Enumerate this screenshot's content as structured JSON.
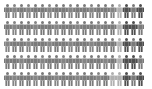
{
  "chart_data": {
    "type": "pictogram",
    "title": "",
    "rows": 5,
    "columns": 20,
    "total_icons": 100,
    "icon": "person-icon",
    "palette": {
      "medium": "#7a7a7a",
      "medium_alt": "#858585",
      "light": "#b0b0b0",
      "dark": "#4f4f4f"
    },
    "grid": [
      [
        "medium",
        "medium_alt",
        "medium",
        "medium_alt",
        "medium",
        "medium",
        "medium_alt",
        "medium",
        "medium",
        "medium_alt",
        "medium",
        "medium",
        "medium_alt",
        "medium",
        "medium",
        "medium_alt",
        "light",
        "dark",
        "medium",
        "dark"
      ],
      [
        "medium",
        "medium_alt",
        "medium",
        "medium",
        "medium_alt",
        "medium",
        "medium",
        "medium_alt",
        "medium",
        "medium",
        "medium_alt",
        "medium",
        "medium",
        "medium_alt",
        "medium",
        "medium",
        "light",
        "dark",
        "dark",
        "medium"
      ],
      [
        "medium_alt",
        "medium",
        "medium",
        "medium_alt",
        "medium",
        "medium",
        "medium_alt",
        "medium",
        "medium",
        "medium_alt",
        "medium",
        "medium",
        "medium_alt",
        "medium",
        "medium",
        "medium",
        "light",
        "dark",
        "medium",
        "dark"
      ],
      [
        "medium",
        "medium",
        "medium_alt",
        "medium",
        "medium",
        "medium_alt",
        "medium",
        "medium",
        "medium_alt",
        "medium",
        "medium",
        "medium_alt",
        "medium",
        "medium",
        "medium_alt",
        "medium",
        "light",
        "dark",
        "dark",
        "medium"
      ],
      [
        "medium",
        "medium_alt",
        "medium",
        "medium",
        "medium_alt",
        "medium",
        "medium",
        "medium_alt",
        "medium",
        "medium",
        "medium_alt",
        "medium",
        "medium",
        "medium_alt",
        "medium",
        "light",
        "light",
        "dark",
        "medium",
        "dark"
      ]
    ],
    "counts": {
      "medium": 80,
      "light": 6,
      "dark": 14
    },
    "legend": [],
    "xlabel": "",
    "ylabel": ""
  }
}
